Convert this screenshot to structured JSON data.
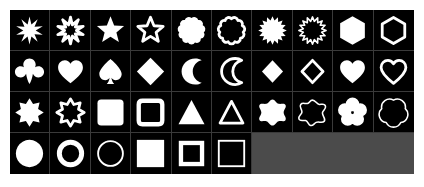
{
  "app": {
    "title": "Shape Palette",
    "background_color": "#ffffff",
    "cell_background_color": "#000000",
    "shape_color": "#ffffff",
    "grid_line_color": "#3a3a3a",
    "empty_area_color": "#4b4b4b"
  },
  "grid": {
    "columns": 10,
    "rows": 4,
    "total_shapes": 36,
    "empty_cells": 4
  },
  "shapes": [
    {
      "row": 1,
      "col": 1,
      "name": "star-10-point-filled",
      "label": "10-Point Star (Filled)",
      "style": "filled"
    },
    {
      "row": 1,
      "col": 2,
      "name": "star-10-point-outline",
      "label": "10-Point Star (Outline)",
      "style": "outline"
    },
    {
      "row": 1,
      "col": 3,
      "name": "star-5-point-filled",
      "label": "5-Point Star (Filled)",
      "style": "filled"
    },
    {
      "row": 1,
      "col": 4,
      "name": "star-5-point-outline",
      "label": "5-Point Star (Outline)",
      "style": "outline"
    },
    {
      "row": 1,
      "col": 5,
      "name": "scalloped-circle-filled",
      "label": "Scalloped Circle (Filled)",
      "style": "filled"
    },
    {
      "row": 1,
      "col": 6,
      "name": "scalloped-circle-outline",
      "label": "Scalloped Circle (Outline)",
      "style": "outline"
    },
    {
      "row": 1,
      "col": 7,
      "name": "sunburst-filled",
      "label": "Sunburst (Filled)",
      "style": "filled"
    },
    {
      "row": 1,
      "col": 8,
      "name": "sunburst-outline",
      "label": "Sunburst (Outline)",
      "style": "outline"
    },
    {
      "row": 1,
      "col": 9,
      "name": "hexagon-filled",
      "label": "Hexagon (Filled)",
      "style": "filled"
    },
    {
      "row": 1,
      "col": 10,
      "name": "hexagon-outline",
      "label": "Hexagon (Outline)",
      "style": "outline"
    },
    {
      "row": 2,
      "col": 1,
      "name": "club-filled",
      "label": "Club (Filled)",
      "style": "filled"
    },
    {
      "row": 2,
      "col": 2,
      "name": "heart-filled",
      "label": "Heart (Filled)",
      "style": "filled"
    },
    {
      "row": 2,
      "col": 3,
      "name": "spade-filled",
      "label": "Spade (Filled)",
      "style": "filled"
    },
    {
      "row": 2,
      "col": 4,
      "name": "diamond-large-filled",
      "label": "Diamond (Filled)",
      "style": "filled"
    },
    {
      "row": 2,
      "col": 5,
      "name": "crescent-moon-filled",
      "label": "Crescent Moon (Filled)",
      "style": "filled"
    },
    {
      "row": 2,
      "col": 6,
      "name": "crescent-moon-outline",
      "label": "Crescent Moon (Outline)",
      "style": "outline"
    },
    {
      "row": 2,
      "col": 7,
      "name": "diamond-small-filled",
      "label": "Diamond Small (Filled)",
      "style": "filled"
    },
    {
      "row": 2,
      "col": 8,
      "name": "diamond-small-outline",
      "label": "Diamond Small (Outline)",
      "style": "outline"
    },
    {
      "row": 2,
      "col": 9,
      "name": "heart-round-filled",
      "label": "Heart Round (Filled)",
      "style": "filled"
    },
    {
      "row": 2,
      "col": 10,
      "name": "heart-round-outline",
      "label": "Heart Round (Outline)",
      "style": "outline"
    },
    {
      "row": 3,
      "col": 1,
      "name": "star-8-point-filled",
      "label": "8-Point Star (Filled)",
      "style": "filled"
    },
    {
      "row": 3,
      "col": 2,
      "name": "star-8-point-outline",
      "label": "8-Point Star (Outline)",
      "style": "outline"
    },
    {
      "row": 3,
      "col": 3,
      "name": "rounded-square-filled",
      "label": "Rounded Square (Filled)",
      "style": "filled"
    },
    {
      "row": 3,
      "col": 4,
      "name": "rounded-square-outline",
      "label": "Rounded Square (Outline)",
      "style": "outline"
    },
    {
      "row": 3,
      "col": 5,
      "name": "triangle-filled",
      "label": "Triangle (Filled)",
      "style": "filled"
    },
    {
      "row": 3,
      "col": 6,
      "name": "triangle-outline",
      "label": "Triangle (Outline)",
      "style": "outline"
    },
    {
      "row": 3,
      "col": 7,
      "name": "splat-star-filled",
      "label": "Splat Star (Filled)",
      "style": "filled"
    },
    {
      "row": 3,
      "col": 8,
      "name": "splat-star-outline",
      "label": "Splat Star (Outline)",
      "style": "outline"
    },
    {
      "row": 3,
      "col": 9,
      "name": "flower-5-petal-filled",
      "label": "5-Petal Flower (Filled)",
      "style": "filled"
    },
    {
      "row": 3,
      "col": 10,
      "name": "flower-5-petal-outline",
      "label": "5-Petal Flower (Outline)",
      "style": "outline"
    },
    {
      "row": 4,
      "col": 1,
      "name": "circle-filled",
      "label": "Circle (Filled)",
      "style": "filled"
    },
    {
      "row": 4,
      "col": 2,
      "name": "circle-ring-thick",
      "label": "Circle Ring (Thick)",
      "style": "outline"
    },
    {
      "row": 4,
      "col": 3,
      "name": "circle-ring-thin",
      "label": "Circle Ring (Thin)",
      "style": "outline"
    },
    {
      "row": 4,
      "col": 4,
      "name": "square-filled",
      "label": "Square (Filled)",
      "style": "filled"
    },
    {
      "row": 4,
      "col": 5,
      "name": "square-ring-thick",
      "label": "Square Ring (Thick)",
      "style": "outline"
    },
    {
      "row": 4,
      "col": 6,
      "name": "square-ring-thin",
      "label": "Square Ring (Thin)",
      "style": "outline"
    },
    {
      "row": 4,
      "col": 7,
      "name": "empty-slot",
      "label": "",
      "style": "empty"
    },
    {
      "row": 4,
      "col": 8,
      "name": "empty-slot",
      "label": "",
      "style": "empty"
    },
    {
      "row": 4,
      "col": 9,
      "name": "empty-slot",
      "label": "",
      "style": "empty"
    },
    {
      "row": 4,
      "col": 10,
      "name": "empty-slot",
      "label": "",
      "style": "empty"
    }
  ]
}
